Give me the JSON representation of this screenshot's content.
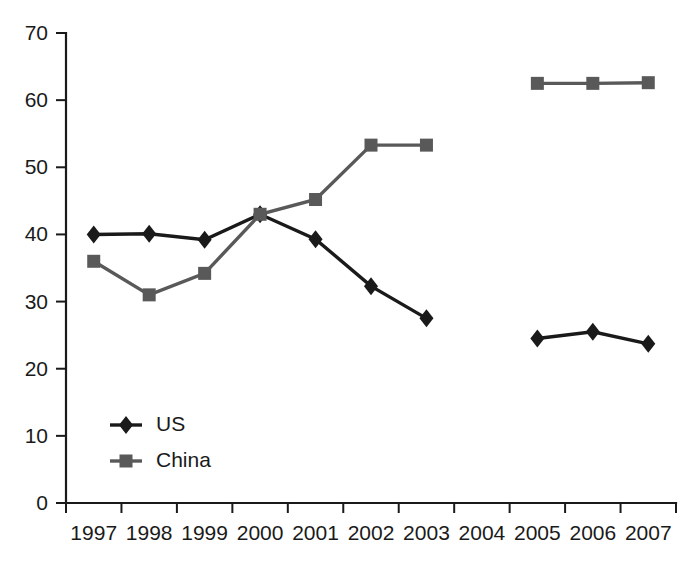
{
  "chart_data": {
    "type": "line",
    "title": "",
    "xlabel": "",
    "ylabel": "",
    "categories": [
      "1997",
      "1998",
      "1999",
      "2000",
      "2001",
      "2002",
      "2003",
      "2004",
      "2005",
      "2006",
      "2007"
    ],
    "yticks": [
      0,
      10,
      20,
      30,
      40,
      50,
      60,
      70
    ],
    "ylim": [
      0,
      70
    ],
    "grid": false,
    "legend_position": "inside-lower-left",
    "series": [
      {
        "name": "US",
        "color": "#1a1a1a",
        "marker": "diamond",
        "values": [
          40.0,
          40.1,
          39.2,
          43.0,
          39.3,
          32.3,
          27.5,
          null,
          24.5,
          25.5,
          23.7
        ]
      },
      {
        "name": "China",
        "color": "#595959",
        "marker": "square",
        "values": [
          36.0,
          31.0,
          34.2,
          43.0,
          45.2,
          53.3,
          53.3,
          null,
          62.5,
          62.5,
          62.6
        ]
      }
    ]
  },
  "axes": {
    "y_tick_labels": [
      "70",
      "60",
      "50",
      "40",
      "30",
      "20",
      "10",
      "0"
    ],
    "x_tick_labels": [
      "1997",
      "1998",
      "1999",
      "2000",
      "2001",
      "2002",
      "2003",
      "2004",
      "2005",
      "2006",
      "2007"
    ]
  },
  "legend": {
    "items": [
      {
        "label": "US",
        "color": "#1a1a1a",
        "marker": "diamond"
      },
      {
        "label": "China",
        "color": "#595959",
        "marker": "square"
      }
    ]
  }
}
